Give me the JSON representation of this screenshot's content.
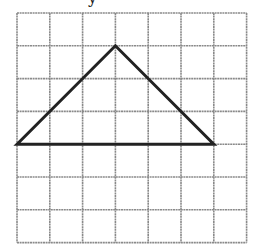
{
  "diagram": {
    "type": "grid-triangle",
    "top_partial_text": "y",
    "grid": {
      "columns": 7,
      "rows": 7,
      "origin_x": 17,
      "origin_y": 13,
      "cell_size": 32.8,
      "line_color": "#8a8a8a"
    },
    "triangle": {
      "stroke_color": "#222222",
      "vertices_grid": [
        [
          0,
          4
        ],
        [
          3,
          1
        ],
        [
          6,
          4
        ]
      ],
      "description": "Isosceles triangle with base 6 units and height 3 units"
    }
  }
}
